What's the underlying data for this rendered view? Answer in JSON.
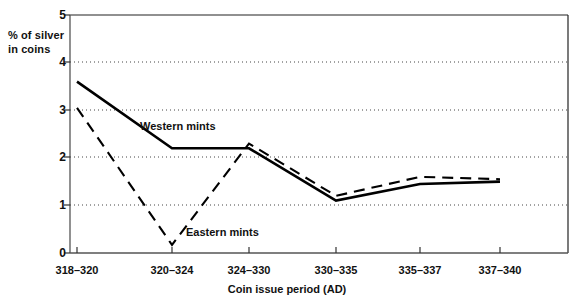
{
  "chart_data": {
    "type": "line",
    "title": "",
    "xlabel": "Coin issue period  (AD)",
    "ylabel": "% of silver\nin coins",
    "categories": [
      "318–320",
      "320–324",
      "324–330",
      "330–335",
      "335–337",
      "337–340"
    ],
    "yticks": [
      "0",
      "1",
      "2",
      "3",
      "4",
      "5"
    ],
    "ylim": [
      0,
      5
    ],
    "grid": "horizontal-dotted",
    "legend": "inline-annotations",
    "series": [
      {
        "name": "Western mints",
        "style": "solid",
        "color": "#000000",
        "values": [
          3.6,
          2.2,
          2.2,
          1.1,
          1.45,
          1.5
        ]
      },
      {
        "name": "Eastern mints",
        "style": "dashed",
        "color": "#000000",
        "values": [
          3.05,
          0.17,
          2.3,
          1.2,
          1.6,
          1.55
        ]
      }
    ],
    "annotations": [
      {
        "text": "Western mints",
        "series": "Western mints"
      },
      {
        "text": "Eastern mints",
        "series": "Eastern mints"
      }
    ]
  },
  "axis": {
    "y_label_text": "% of silver\nin coins",
    "x_title_text": "Coin issue period  (AD)"
  }
}
